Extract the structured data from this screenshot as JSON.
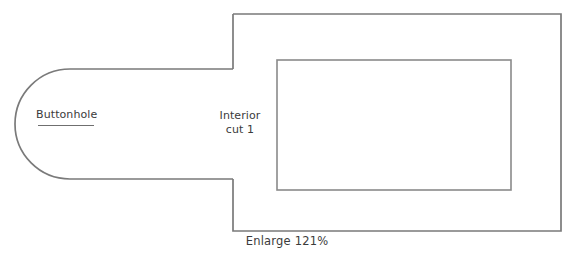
{
  "diagram": {
    "title_caption": "Enlarge 121%",
    "stroke_color": "#7a7a7a",
    "inner_stroke_color": "#8a8a8a",
    "text_color": "#3b3b3b",
    "background_color": "#ffffff",
    "labels": {
      "buttonhole": "Buttonhole",
      "interior_line1": "Interior",
      "interior_line2": "cut 1"
    },
    "shapes": {
      "tab_name": "rounded-tab",
      "body_name": "outer-rectangle",
      "inner_name": "inner-rectangle",
      "mark_name": "buttonhole-mark"
    }
  }
}
